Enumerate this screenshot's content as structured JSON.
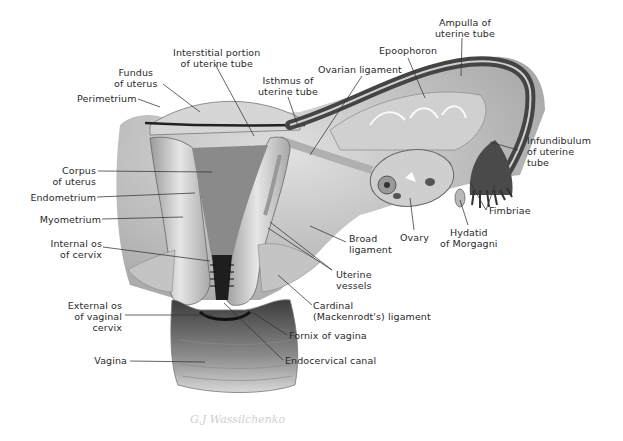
{
  "figure": {
    "signature": "G.J Wassilchenko"
  },
  "labels": {
    "perimetrium": "Perimetrium",
    "fundus": "Fundus\nof uterus",
    "interstitial": "Interstitial portion\nof uterine tube",
    "isthmus": "Isthmus of\nuterine tube",
    "ovarian_ligament": "Ovarian ligament",
    "epoophoron": "Epoophoron",
    "ampulla": "Ampulla of\nuterine tube",
    "infundibulum": "Infundibulum\nof uterine\ntube",
    "fimbriae": "Fimbriae",
    "hydatid": "Hydatid\nof Morgagni",
    "ovary": "Ovary",
    "broad_ligament": "Broad\nligament",
    "uterine_vessels": "Uterine\nvessels",
    "cardinal_ligament": "Cardinal\n(Mackenrodt's) ligament",
    "fornix": "Fornix of vagina",
    "endocervical": "Endocervical canal",
    "corpus": "Corpus\nof uterus",
    "endometrium": "Endometrium",
    "myometrium": "Myometrium",
    "internal_os": "Internal os\nof cervix",
    "external_os": "External os\nof vaginal\ncervix",
    "vagina": "Vagina"
  },
  "colors": {
    "tissue_light": "#e4e4e4",
    "tissue_mid": "#bdbdbd",
    "tissue_dark": "#3a3a3a",
    "leader": "#333333",
    "text": "#2a2a2a"
  }
}
